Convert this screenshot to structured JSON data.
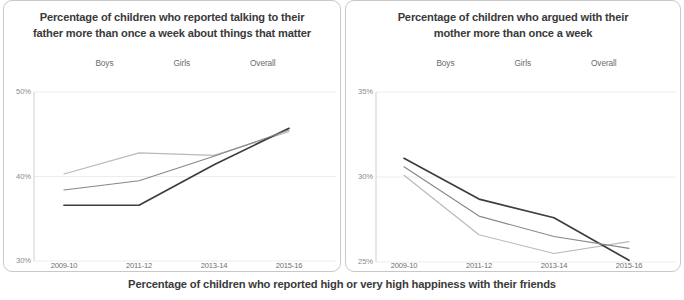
{
  "caption": "Percentage of children who reported high or very high happiness with their friends",
  "palette": {
    "boys": "#b9b9b9",
    "girls": "#3d3d3d",
    "overall": "#888888",
    "grid": "#ececec",
    "axis": "#cfcfcf",
    "panel_border": "#c8c8c8",
    "title_text": "#3a3a3a",
    "tick_text": "#8a8a8a"
  },
  "legend": {
    "boys": "Boys",
    "girls": "Girls",
    "overall": "Overall"
  },
  "chart_data": [
    {
      "panel": "left",
      "type": "line",
      "title": "Percentage of children who reported talking to their father more than once a week about things that matter",
      "title_line1": "Percentage of children who reported talking to their",
      "title_line2": "father more than once a week about things that matter",
      "xlabel": "",
      "ylabel": "",
      "categories": [
        "2009-10",
        "2011-12",
        "2013-14",
        "2015-16"
      ],
      "ylim": [
        30,
        50
      ],
      "yticks": [
        "30%",
        "40%",
        "50%"
      ],
      "ytick_values": [
        30,
        40,
        50
      ],
      "grid": true,
      "legend_position": "top",
      "series": [
        {
          "name": "Boys",
          "color": "#b9b9b9",
          "values": [
            40.3,
            42.8,
            42.5,
            45.3
          ]
        },
        {
          "name": "Girls",
          "color": "#3d3d3d",
          "values": [
            36.6,
            36.6,
            41.4,
            45.7
          ]
        },
        {
          "name": "Overall",
          "color": "#888888",
          "values": [
            38.4,
            39.5,
            42.4,
            45.5
          ]
        }
      ]
    },
    {
      "panel": "right",
      "type": "line",
      "title": "Percentage of children who argued with their mother more than once a week",
      "title_line1": "Percentage of children who argued with their",
      "title_line2": "mother more than once a week",
      "xlabel": "",
      "ylabel": "",
      "categories": [
        "2009-10",
        "2011-12",
        "2013-14",
        "2015-16"
      ],
      "ylim": [
        25,
        35
      ],
      "yticks": [
        "25%",
        "30%",
        "35%"
      ],
      "ytick_values": [
        25,
        30,
        35
      ],
      "grid": true,
      "legend_position": "top",
      "series": [
        {
          "name": "Boys",
          "color": "#b9b9b9",
          "values": [
            30.1,
            26.6,
            25.5,
            26.2
          ]
        },
        {
          "name": "Girls",
          "color": "#3d3d3d",
          "values": [
            31.1,
            28.7,
            27.6,
            25.1
          ]
        },
        {
          "name": "Overall",
          "color": "#888888",
          "values": [
            30.6,
            27.7,
            26.5,
            25.8
          ]
        }
      ]
    }
  ]
}
